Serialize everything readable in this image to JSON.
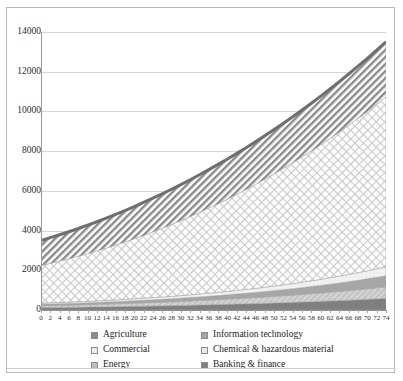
{
  "chart_data": {
    "type": "area",
    "stacked": true,
    "title": "",
    "xlabel": "",
    "ylabel": "",
    "xlim": [
      0,
      74
    ],
    "ylim": [
      0,
      14000
    ],
    "ytick_step": 2000,
    "xtick_step": 2,
    "grid": true,
    "legend_position": "bottom",
    "yticks": [
      "0",
      "2000",
      "4000",
      "6000",
      "8000",
      "10000",
      "12000",
      "14000"
    ],
    "x": [
      0,
      2,
      4,
      6,
      8,
      10,
      12,
      14,
      16,
      18,
      20,
      22,
      24,
      26,
      28,
      30,
      32,
      34,
      36,
      38,
      40,
      42,
      44,
      46,
      48,
      50,
      52,
      54,
      56,
      58,
      60,
      62,
      64,
      66,
      68,
      70,
      72,
      74
    ],
    "series": [
      {
        "name": "Banking & finance",
        "color": "#7f7f7f",
        "pattern": "solid",
        "values": [
          120,
          125,
          130,
          136,
          142,
          148,
          155,
          162,
          169,
          177,
          185,
          193,
          202,
          211,
          221,
          231,
          241,
          252,
          263,
          275,
          287,
          300,
          313,
          327,
          341,
          356,
          371,
          387,
          404,
          421,
          439,
          458,
          477,
          497,
          518,
          540,
          562,
          585
        ]
      },
      {
        "name": "Energy",
        "color": "#bdbdbd",
        "pattern": "light-diagonal",
        "values": [
          95,
          100,
          105,
          110,
          116,
          122,
          128,
          135,
          142,
          149,
          157,
          165,
          174,
          183,
          192,
          202,
          213,
          224,
          235,
          247,
          260,
          273,
          287,
          301,
          316,
          332,
          348,
          365,
          383,
          401,
          421,
          441,
          462,
          484,
          507,
          531,
          556,
          582
        ]
      },
      {
        "name": "Information technology",
        "color": "#a6a6a6",
        "pattern": "solid",
        "values": [
          70,
          74,
          78,
          82,
          87,
          92,
          97,
          103,
          109,
          115,
          122,
          129,
          137,
          145,
          153,
          162,
          172,
          182,
          193,
          204,
          216,
          229,
          242,
          256,
          271,
          287,
          303,
          321,
          339,
          358,
          379,
          400,
          423,
          447,
          472,
          498,
          526,
          555
        ]
      },
      {
        "name": "Chemical & hazardous material",
        "color": "#e8e8e8",
        "pattern": "light-dots",
        "values": [
          60,
          63,
          66,
          69,
          73,
          77,
          81,
          85,
          90,
          95,
          100,
          106,
          112,
          118,
          125,
          132,
          140,
          148,
          156,
          165,
          175,
          185,
          195,
          207,
          219,
          231,
          245,
          259,
          274,
          290,
          306,
          324,
          343,
          363,
          384,
          406,
          430,
          455
        ]
      },
      {
        "name": "Commercial",
        "color": "#efefef",
        "pattern": "cross-hatch",
        "values": [
          1900,
          1990,
          2085,
          2185,
          2290,
          2400,
          2515,
          2635,
          2760,
          2890,
          3025,
          3165,
          3310,
          3460,
          3615,
          3775,
          3940,
          4110,
          4285,
          4465,
          4650,
          4840,
          5035,
          5235,
          5440,
          5650,
          5865,
          6085,
          6310,
          6540,
          6775,
          7015,
          7260,
          7510,
          7765,
          8025,
          8290,
          8560
        ]
      },
      {
        "name": "Agriculture",
        "color": "#8a8a8a",
        "pattern": "diagonal-hatch",
        "values": [
          1255,
          1290,
          1325,
          1360,
          1396,
          1432,
          1469,
          1506,
          1543,
          1581,
          1619,
          1657,
          1696,
          1735,
          1774,
          1814,
          1854,
          1894,
          1935,
          1976,
          2017,
          2059,
          2101,
          2143,
          2186,
          2229,
          2272,
          2316,
          2360,
          2404,
          2449,
          2494,
          2539,
          2585,
          2631,
          2677,
          2724,
          2771
        ]
      }
    ],
    "totals_note": {
      "start_total": 3500,
      "end_total": 11608
    }
  },
  "legend": {
    "items": [
      {
        "label": "Agriculture"
      },
      {
        "label": "Information technology"
      },
      {
        "label": "Commercial"
      },
      {
        "label": "Chemical & hazardous material"
      },
      {
        "label": "Energy"
      },
      {
        "label": "Banking & finance"
      }
    ]
  },
  "colors": {
    "frame": "#b9b9b9",
    "grid": "#d6d6d6",
    "axis": "#8f8f8f",
    "text": "#1e1e1e",
    "top_border": "#6e6e6e"
  }
}
